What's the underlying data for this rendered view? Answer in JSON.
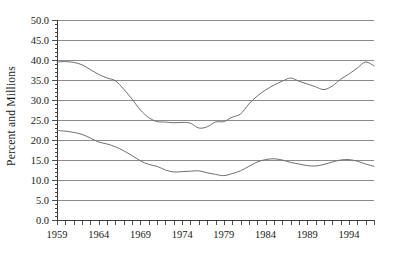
{
  "chart_data": {
    "type": "line",
    "title": "",
    "subtitle": "",
    "xlabel": "",
    "ylabel": "Percent and Millions",
    "xlim": [
      1959,
      1997
    ],
    "ylim": [
      0,
      50
    ],
    "grid": true,
    "legend": "none",
    "y_ticks": [
      "0.0",
      "5.0",
      "10.0",
      "15.0",
      "20.0",
      "25.0",
      "30.0",
      "35.0",
      "40.0",
      "45.0",
      "50.0"
    ],
    "y_tick_values": [
      0,
      5,
      10,
      15,
      20,
      25,
      30,
      35,
      40,
      45,
      50
    ],
    "x_tick_labels": [
      "1959",
      "1964",
      "1969",
      "1974",
      "1979",
      "1984",
      "1989",
      "1994"
    ],
    "x_tick_label_values": [
      1959,
      1964,
      1969,
      1974,
      1979,
      1984,
      1989,
      1994
    ],
    "x_minor_tick_values": [
      1959,
      1960,
      1961,
      1962,
      1963,
      1964,
      1965,
      1966,
      1967,
      1968,
      1969,
      1970,
      1971,
      1972,
      1973,
      1974,
      1975,
      1976,
      1977,
      1978,
      1979,
      1980,
      1981,
      1982,
      1983,
      1984,
      1985,
      1986,
      1987,
      1988,
      1989,
      1990,
      1991,
      1992,
      1993,
      1994,
      1995,
      1996,
      1997
    ],
    "x": [
      1959,
      1960,
      1961,
      1962,
      1963,
      1964,
      1965,
      1966,
      1967,
      1968,
      1969,
      1970,
      1971,
      1972,
      1973,
      1974,
      1975,
      1976,
      1977,
      1978,
      1979,
      1980,
      1981,
      1982,
      1983,
      1984,
      1985,
      1986,
      1987,
      1988,
      1989,
      1990,
      1991,
      1992,
      1993,
      1994,
      1995,
      1996,
      1997
    ],
    "series": [
      {
        "name": "upper-series",
        "color": "#6f6f6f",
        "values": [
          39.5,
          39.6,
          39.4,
          38.8,
          37.6,
          36.4,
          35.5,
          34.8,
          32.7,
          30.2,
          27.5,
          25.6,
          24.6,
          24.5,
          24.3,
          24.4,
          24.2,
          23.0,
          23.3,
          24.5,
          24.6,
          25.7,
          26.5,
          29.0,
          31.0,
          32.5,
          33.7,
          34.7,
          35.5,
          34.7,
          34.0,
          33.3,
          32.6,
          33.5,
          35.2,
          36.5,
          38.0,
          39.5,
          38.5
        ]
      },
      {
        "name": "lower-series",
        "color": "#6f6f6f",
        "values": [
          22.4,
          22.2,
          21.9,
          21.4,
          20.5,
          19.5,
          19.0,
          18.3,
          17.3,
          16.1,
          14.8,
          13.9,
          13.4,
          12.5,
          12.0,
          12.1,
          12.2,
          12.3,
          11.8,
          11.4,
          11.1,
          11.6,
          12.3,
          13.4,
          14.5,
          15.1,
          15.3,
          15.0,
          14.4,
          14.0,
          13.6,
          13.5,
          13.9,
          14.5,
          15.0,
          15.1,
          14.7,
          14.0,
          13.4
        ]
      }
    ]
  }
}
